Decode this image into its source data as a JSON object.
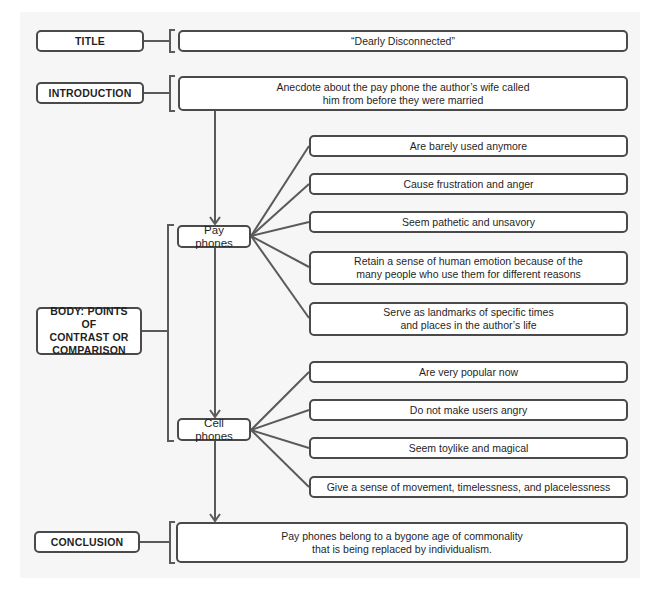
{
  "heading_partial": "...lying a Contrast...",
  "sections": {
    "title": {
      "label": "TITLE",
      "content": "“Dearly Disconnected”"
    },
    "introduction": {
      "label": "INTRODUCTION",
      "content_line1": "Anecdote about the pay phone the author’s wife called",
      "content_line2": "him from before they were married"
    },
    "body": {
      "label_line1": "BODY: POINTS OF",
      "label_line2": "CONTRAST OR",
      "label_line3": "COMPARISON",
      "pay_phones": {
        "label": "Pay phones",
        "points": [
          {
            "line1": "Are barely used anymore"
          },
          {
            "line1": "Cause frustration and anger"
          },
          {
            "line1": "Seem pathetic and unsavory"
          },
          {
            "line1": "Retain a sense of human emotion because of the",
            "line2": "many people who use them for different reasons"
          },
          {
            "line1": "Serve as landmarks of specific times",
            "line2": "and places in the author’s life"
          }
        ]
      },
      "cell_phones": {
        "label": "Cell phones",
        "points": [
          {
            "line1": "Are very popular now"
          },
          {
            "line1": "Do not make users angry"
          },
          {
            "line1": "Seem toylike and magical"
          },
          {
            "line1": "Give a sense of movement, timelessness, and placelessness"
          }
        ]
      }
    },
    "conclusion": {
      "label": "CONCLUSION",
      "content_line1": "Pay phones belong to a bygone age of commonality",
      "content_line2": "that is being replaced by individualism."
    }
  },
  "colors": {
    "panel": "#f6f6f6",
    "line": "#5a5a5a",
    "border": "#4a4a4a"
  }
}
